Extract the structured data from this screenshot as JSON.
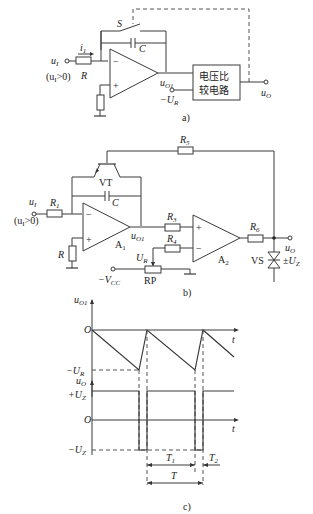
{
  "figure_a": {
    "caption": "a)",
    "switch_label": "S",
    "capacitor_label": "C",
    "input_label": "u",
    "input_sub": "I",
    "input_condition": "(u",
    "input_condition_sub": "I",
    "input_condition_rest": ">0)",
    "current_label": "i",
    "current_sub": "1",
    "resistor_label": "R",
    "opamp_minus": "−",
    "opamp_plus": "+",
    "output_node_label": "u",
    "output_node_sub": "O1",
    "reference_label": "−U",
    "reference_sub": "R",
    "comparator_line1": "电压比",
    "comparator_line2": "较电路",
    "output_label": "u",
    "output_sub": "O"
  },
  "figure_b": {
    "caption": "b)",
    "r5_label": "R",
    "r5_sub": "5",
    "transistor_label": "VT",
    "capacitor_label": "C",
    "input_label": "u",
    "input_sub": "I",
    "input_condition": "(u",
    "input_condition_sub": "I",
    "input_condition_rest": ">0)",
    "r1_label": "R",
    "r1_sub": "1",
    "r_label": "R",
    "a1_label": "A",
    "a1_sub": "1",
    "uo1_label": "u",
    "uo1_sub": "O1",
    "r3_label": "R",
    "r3_sub": "3",
    "r4_label": "R",
    "r4_sub": "4",
    "ur_label": "U",
    "ur_sub": "R",
    "vcc_label": "−V",
    "vcc_sub": "CC",
    "rp_label": "RP",
    "a2_label": "A",
    "a2_sub": "2",
    "r6_label": "R",
    "r6_sub": "6",
    "output_label": "u",
    "output_sub": "O",
    "zener_label": "VS",
    "zener_value": "±U",
    "zener_value_sub": "Z",
    "minus": "−",
    "plus": "+"
  },
  "figure_c": {
    "caption": "c)",
    "top_axis_label": "u",
    "top_axis_sub": "O1",
    "top_origin": "O",
    "top_t": "t",
    "top_min_label": "−U",
    "top_min_sub": "R",
    "bottom_axis_label": "u",
    "bottom_axis_sub": "O",
    "bottom_plus": "+U",
    "bottom_plus_sub": "Z",
    "bottom_origin": "O",
    "bottom_t": "t",
    "bottom_minus": "−U",
    "bottom_minus_sub": "Z",
    "t1_label": "T",
    "t1_sub": "1",
    "t2_label": "T",
    "t2_sub": "2",
    "period_label": "T"
  }
}
